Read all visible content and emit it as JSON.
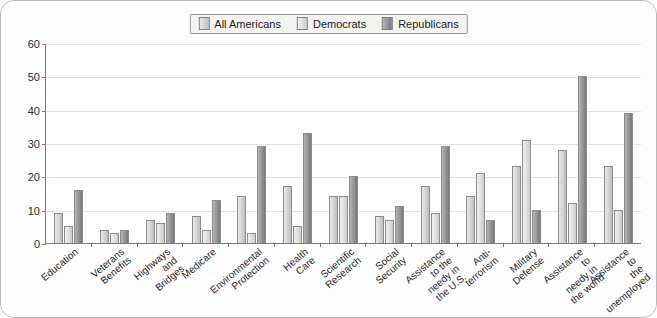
{
  "chart_data": {
    "type": "bar",
    "title": "",
    "xlabel": "",
    "ylabel": "",
    "ylim": [
      0,
      60
    ],
    "yticks": [
      0,
      10,
      20,
      30,
      40,
      50,
      60
    ],
    "grid": true,
    "legend_position": "top-center",
    "categories": [
      "Education",
      "Veterans\nBenefits",
      "Highways\nand Bridges",
      "Medicare",
      "Environmental\nProtection",
      "Health Care",
      "Scientific Research",
      "Social Security",
      "Assistance to the\nneedy in the U.S.",
      "Anti-terrorism",
      "Military Defense",
      "Assistance to\nneedy in the world",
      "Assistance to\nthe unemployed"
    ],
    "series": [
      {
        "name": "All Americans",
        "color": "#d7d7d7",
        "values": [
          9,
          4,
          7,
          8,
          14,
          17,
          14,
          8,
          17,
          14,
          23,
          28,
          23
        ]
      },
      {
        "name": "Democrats",
        "color": "#e8e8e8",
        "values": [
          5,
          3,
          6,
          4,
          3,
          5,
          14,
          7,
          9,
          21,
          31,
          12,
          10
        ]
      },
      {
        "name": "Republicans",
        "color": "#8f8f8f",
        "values": [
          16,
          4,
          9,
          13,
          29,
          33,
          20,
          11,
          29,
          7,
          10,
          50,
          39
        ]
      }
    ]
  },
  "legend": {
    "items": [
      {
        "label": "All Americans"
      },
      {
        "label": "Democrats"
      },
      {
        "label": "Republicans"
      }
    ]
  },
  "colors": {
    "border": "#b9b9b9",
    "axis": "#7d7d7d",
    "gridline": "#e3e3e3",
    "plot_background": "#ffffff"
  }
}
